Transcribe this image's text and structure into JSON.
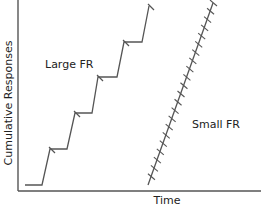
{
  "chart_data": {
    "type": "line",
    "title": "",
    "xlabel": "Time",
    "ylabel": "Cumulative Responses",
    "grid": false,
    "legend": "none",
    "annotations": [
      "Large FR",
      "Small FR"
    ],
    "series": [
      {
        "name": "Large FR",
        "description": "Stepped cumulative record: pause after each reinforcement, then rapid run of responses",
        "points": [
          [
            25,
            185
          ],
          [
            42,
            185
          ],
          [
            50,
            149
          ],
          [
            67,
            149
          ],
          [
            75,
            113
          ],
          [
            92,
            113
          ],
          [
            98,
            77
          ],
          [
            117,
            77
          ],
          [
            124,
            42
          ],
          [
            142,
            42
          ],
          [
            149,
            6
          ]
        ],
        "reinforcement_marks": [
          [
            50,
            149
          ],
          [
            75,
            113
          ],
          [
            98,
            77
          ],
          [
            124,
            42
          ],
          [
            149,
            6
          ]
        ]
      },
      {
        "name": "Small FR",
        "description": "Steep, nearly constant rate with frequent reinforcement marks",
        "points": [
          [
            148,
            185
          ],
          [
            213,
            3
          ]
        ],
        "reinforcement_mark_count": 22
      }
    ]
  },
  "labels": {
    "y_axis": "Cumulative Responses",
    "x_axis": "Time",
    "large_fr": "Large FR",
    "small_fr": "Small FR"
  },
  "colors": {
    "line": "#555555",
    "axis": "#555555",
    "text": "#222222"
  }
}
